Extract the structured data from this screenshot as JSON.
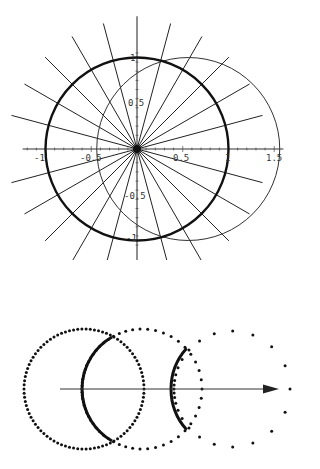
{
  "top_plot": {
    "origin_px": [
      137,
      149
    ],
    "unit_px": 91.5,
    "x_axis": {
      "from": -1.25,
      "to": 1.6,
      "ticks": [
        -1,
        -0.5,
        0.5,
        1,
        1.5
      ],
      "minor_step": 0.1
    },
    "y_axis": {
      "from": -1.1,
      "to": 1.45,
      "ticks": [
        1,
        0.5,
        -0.5,
        -1
      ],
      "minor_step": 0.1
    },
    "labels": {
      "x_m1": "-1",
      "x_m05": "-0.5",
      "x_05": "0.5",
      "x_1": "1",
      "x_15": "1.5",
      "y_1": "1",
      "y_05": "0.5",
      "y_m05": "-0.5",
      "y_m1": "-1"
    },
    "bold_circle": {
      "center": [
        0,
        0
      ],
      "radius": 1
    },
    "thin_circle": {
      "center": [
        0.56,
        0
      ],
      "radius": 1
    },
    "radial_lines": {
      "count": 24,
      "step_deg": 15,
      "length": 1.42
    },
    "colors": {
      "line": "#222222",
      "axis": "#333333"
    }
  },
  "bottom_diagram": {
    "arrow": {
      "from": [
        60,
        389
      ],
      "to": [
        279,
        389
      ]
    },
    "dotted_circles": [
      {
        "name": "circle-1",
        "center": [
          84,
          389
        ],
        "radius": 60,
        "dots": 90,
        "skew": 0.0
      },
      {
        "name": "circle-2",
        "center": [
          142,
          389
        ],
        "radius": 60,
        "dots": 60,
        "skew": 0.55
      },
      {
        "name": "circle-3",
        "center": [
          232,
          389
        ],
        "radius": 58,
        "dots": 26,
        "skew": 0.8
      }
    ],
    "bold_arcs": [
      {
        "name": "arc-1",
        "center": [
          142,
          389
        ],
        "radius": 60,
        "from_deg": 120,
        "to_deg": 240
      },
      {
        "name": "arc-2",
        "center": [
          232,
          389
        ],
        "radius": 61,
        "from_deg": 138,
        "to_deg": 222
      }
    ],
    "colors": {
      "dot": "#111111",
      "arc": "#111111",
      "arrow": "#333333"
    }
  }
}
